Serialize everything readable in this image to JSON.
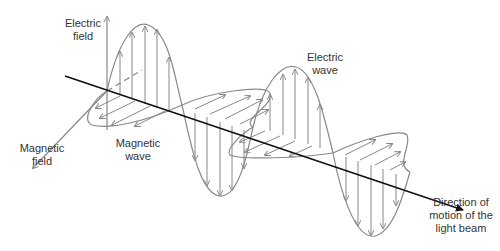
{
  "diagram": {
    "labels": {
      "electric_field": [
        "Electric",
        "field"
      ],
      "magnetic_field": [
        "Magnetic",
        "field"
      ],
      "magnetic_wave": [
        "Magnetic",
        "wave"
      ],
      "electric_wave": [
        "Electric",
        "wave"
      ],
      "direction": [
        "Direction of",
        "motion of the",
        "light beam"
      ]
    },
    "colors": {
      "axis": "#111111",
      "wave": "#888888",
      "text": "#333333",
      "background": "#ffffff"
    }
  }
}
